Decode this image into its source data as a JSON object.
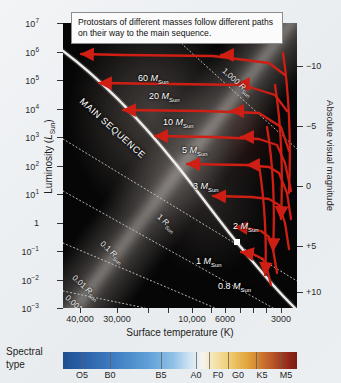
{
  "caption": {
    "text": "Protostars of different masses follow different paths on their way to the main sequence."
  },
  "axes": {
    "y_label_prefix": "Luminosity (",
    "y_label_symbol": "L",
    "y_label_sub": "Sun",
    "y_label_suffix": ")",
    "x_label": "Surface temperature (K)",
    "right_label": "Absolute visual magnitude",
    "y_ticks": [
      {
        "base": "10",
        "exp": "7",
        "plain": null,
        "y": 23
      },
      {
        "base": "10",
        "exp": "6",
        "plain": null,
        "y": 51.5
      },
      {
        "base": "10",
        "exp": "5",
        "plain": null,
        "y": 80
      },
      {
        "base": "10",
        "exp": "4",
        "plain": null,
        "y": 108.5
      },
      {
        "base": "10",
        "exp": "3",
        "plain": null,
        "y": 137
      },
      {
        "base": "10",
        "exp": "2",
        "plain": null,
        "y": 165.5
      },
      {
        "base": "10",
        "exp": "1",
        "plain": null,
        "y": 194
      },
      {
        "base": null,
        "exp": null,
        "plain": "1",
        "y": 222.5
      },
      {
        "base": "10",
        "exp": "−1",
        "plain": null,
        "y": 251
      },
      {
        "base": "10",
        "exp": "−2",
        "plain": null,
        "y": 279.5
      },
      {
        "base": "10",
        "exp": "−3",
        "plain": null,
        "y": 308
      }
    ],
    "right_ticks": [
      {
        "label": "−10",
        "y": 66
      },
      {
        "label": "−5",
        "y": 126
      },
      {
        "label": "0",
        "y": 186
      },
      {
        "label": "+5",
        "y": 246
      },
      {
        "label": "+10",
        "y": 292
      }
    ],
    "x_ticks": [
      {
        "label": "40,000",
        "x": 80
      },
      {
        "label": "30,000",
        "x": 117
      },
      {
        "label": "",
        "x": 148
      },
      {
        "label": "",
        "x": 168
      },
      {
        "label": "10,000",
        "x": 192
      },
      {
        "label": "",
        "x": 211
      },
      {
        "label": "6000",
        "x": 225
      },
      {
        "label": "",
        "x": 240
      },
      {
        "label": "",
        "x": 253
      },
      {
        "label": "",
        "x": 266
      },
      {
        "label": "3000",
        "x": 281
      }
    ]
  },
  "plot_labels": {
    "main_sequence": "MAIN SEQUENCE",
    "masses": [
      {
        "value": "60",
        "unit_symbol": "M",
        "unit_sub": "Sun",
        "x": 75,
        "y": 50
      },
      {
        "value": "20",
        "unit_symbol": "M",
        "unit_sub": "Sun",
        "x": 86,
        "y": 68
      },
      {
        "value": "10",
        "unit_symbol": "M",
        "unit_sub": "Sun",
        "x": 100,
        "y": 94
      },
      {
        "value": "5",
        "unit_symbol": "M",
        "unit_sub": "Sun",
        "x": 119,
        "y": 122
      },
      {
        "value": "3",
        "unit_symbol": "M",
        "unit_sub": "Sun",
        "x": 130,
        "y": 158
      },
      {
        "value": "2",
        "unit_symbol": "M",
        "unit_sub": "Sun",
        "x": 170,
        "y": 198
      },
      {
        "value": "1",
        "unit_symbol": "M",
        "unit_sub": "Sun",
        "x": 133,
        "y": 233
      },
      {
        "value": "0.8",
        "unit_symbol": "M",
        "unit_sub": "Sun",
        "x": 155,
        "y": 258
      }
    ],
    "radii": [
      {
        "value": "1,000",
        "unit_symbol": "R",
        "unit_sub": "Sun",
        "x": 160,
        "y": 42,
        "rot": 42
      },
      {
        "value": "1",
        "unit_symbol": "R",
        "unit_sub": "Sun",
        "x": 95,
        "y": 188,
        "rot": 42
      },
      {
        "value": "0.1",
        "unit_symbol": "R",
        "unit_sub": "Sun",
        "x": 38,
        "y": 215,
        "rot": 42
      },
      {
        "value": "0.01",
        "unit_symbol": "R",
        "unit_sub": "Sun",
        "x": 10,
        "y": 249,
        "rot": 42
      },
      {
        "value": "0.001",
        "unit_symbol": "R",
        "unit_sub": "Sun",
        "x": 3,
        "y": 269,
        "rot": 42
      }
    ]
  },
  "spectral": {
    "title_line1": "Spectral",
    "title_line2": "type",
    "types": [
      {
        "label": "O5",
        "x": 82
      },
      {
        "label": "B0",
        "x": 110
      },
      {
        "label": "B5",
        "x": 161
      },
      {
        "label": "A0",
        "x": 196
      },
      {
        "label": "F0",
        "x": 218
      },
      {
        "label": "G0",
        "x": 238
      },
      {
        "label": "K5",
        "x": 262
      },
      {
        "label": "M5",
        "x": 286
      }
    ],
    "separators": [
      82,
      110,
      161,
      196,
      209,
      228,
      256,
      281
    ]
  },
  "colors": {
    "track": "#cf1f15",
    "main_sequence_line": "#f2efe9",
    "plot_background": "#050505",
    "page_background": "#eef1f4"
  },
  "chart_data": {
    "type": "line",
    "xlabel": "Surface temperature (K)",
    "ylabel": "Luminosity (L_Sun)",
    "y2label": "Absolute visual magnitude",
    "xlim": [
      45000,
      2600
    ],
    "ylim": [
      0.001,
      10000000
    ],
    "xscale": "log-reversed",
    "yscale": "log",
    "grid": false,
    "legend": "inline-annotations",
    "annotations": [
      "Protostars of different masses follow different paths on their way to the main sequence.",
      "MAIN SEQUENCE"
    ],
    "series": [
      {
        "name": "60 M_Sun",
        "points": [
          [
            3300,
            300000
          ],
          [
            3600,
            700000
          ],
          [
            5200,
            1100000
          ],
          [
            9000,
            1200000
          ],
          [
            20000,
            1100000
          ],
          [
            42000,
            1000000
          ]
        ]
      },
      {
        "name": "20 M_Sun",
        "points": [
          [
            3300,
            40000
          ],
          [
            3700,
            90000
          ],
          [
            6000,
            110000
          ],
          [
            12000,
            105000
          ],
          [
            30000,
            90000
          ]
        ]
      },
      {
        "name": "10 M_Sun",
        "points": [
          [
            3300,
            4000
          ],
          [
            3600,
            11000
          ],
          [
            5500,
            13000
          ],
          [
            11000,
            12000
          ],
          [
            24000,
            10000
          ]
        ]
      },
      {
        "name": "5 M_Sun",
        "points": [
          [
            3400,
            200
          ],
          [
            3500,
            900
          ],
          [
            3600,
            600
          ],
          [
            4500,
            700
          ],
          [
            8000,
            650
          ],
          [
            16000,
            600
          ]
        ]
      },
      {
        "name": "3 M_Sun",
        "points": [
          [
            3400,
            40
          ],
          [
            3500,
            200
          ],
          [
            3700,
            120
          ],
          [
            5000,
            130
          ],
          [
            9000,
            110
          ],
          [
            12000,
            100
          ]
        ]
      },
      {
        "name": "2 M_Sun",
        "points": [
          [
            3400,
            8
          ],
          [
            3500,
            40
          ],
          [
            3700,
            25
          ],
          [
            4800,
            22
          ],
          [
            8500,
            18
          ]
        ]
      },
      {
        "name": "1 M_Sun",
        "points": [
          [
            3500,
            1.2
          ],
          [
            3700,
            6
          ],
          [
            4000,
            3
          ],
          [
            4800,
            1.2
          ],
          [
            5800,
            1.0
          ]
        ]
      },
      {
        "name": "0.8 M_Sun",
        "points": [
          [
            3400,
            0.6
          ],
          [
            3600,
            3
          ],
          [
            3900,
            1.0
          ],
          [
            4400,
            0.5
          ]
        ]
      }
    ],
    "radius_isolines": [
      "1,000 R_Sun",
      "1 R_Sun",
      "0.1 R_Sun",
      "0.01 R_Sun",
      "0.001 R_Sun"
    ],
    "spectral_sequence": [
      "O5",
      "B0",
      "B5",
      "A0",
      "F0",
      "G0",
      "K5",
      "M5"
    ]
  }
}
